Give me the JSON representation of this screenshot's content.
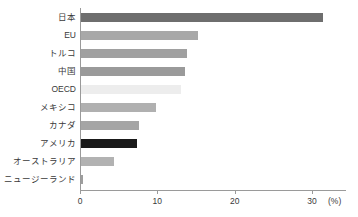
{
  "chart_data": {
    "type": "bar",
    "orientation": "horizontal",
    "title": "",
    "subtitle": "",
    "xlabel": "(%)",
    "ylabel": "",
    "xlim": [
      0,
      34.4
    ],
    "ylim": null,
    "grid": false,
    "legend": null,
    "xticks": [
      0,
      10,
      20,
      30
    ],
    "xticklabels": [
      "0",
      "10",
      "20",
      "30"
    ],
    "unit": "(%)",
    "categories": [
      "日本",
      "EU",
      "トルコ",
      "中国",
      "OECD",
      "メキシコ",
      "カナダ",
      "アメリカ",
      "オーストラリア",
      "ニュージーランド"
    ],
    "values": [
      31.3,
      15.1,
      13.7,
      13.5,
      12.9,
      9.7,
      7.5,
      7.2,
      4.3,
      0.3
    ],
    "bar_colors": [
      "#6e6e6e",
      "#a8a8a8",
      "#a0a0a0",
      "#9a9a9a",
      "#ededed",
      "#b0b0b0",
      "#a5a5a5",
      "#1a1a1a",
      "#b2b2b2",
      "#9e9e9e"
    ],
    "bars": [
      {
        "label": "日本",
        "value": 31.3,
        "color": "#6e6e6e"
      },
      {
        "label": "EU",
        "value": 15.1,
        "color": "#a8a8a8"
      },
      {
        "label": "トルコ",
        "value": 13.7,
        "color": "#a0a0a0"
      },
      {
        "label": "中国",
        "value": 13.5,
        "color": "#9a9a9a"
      },
      {
        "label": "OECD",
        "value": 12.9,
        "color": "#ededed"
      },
      {
        "label": "メキシコ",
        "value": 9.7,
        "color": "#b0b0b0"
      },
      {
        "label": "カナダ",
        "value": 7.5,
        "color": "#a5a5a5"
      },
      {
        "label": "アメリカ",
        "value": 7.2,
        "color": "#1a1a1a"
      },
      {
        "label": "オーストラリア",
        "value": 4.3,
        "color": "#b2b2b2"
      },
      {
        "label": "ニュージーランド",
        "value": 0.3,
        "color": "#9e9e9e"
      }
    ]
  },
  "axis": {
    "tick_0": "0",
    "tick_1": "10",
    "tick_2": "20",
    "tick_3": "30",
    "unit": "(%)"
  }
}
